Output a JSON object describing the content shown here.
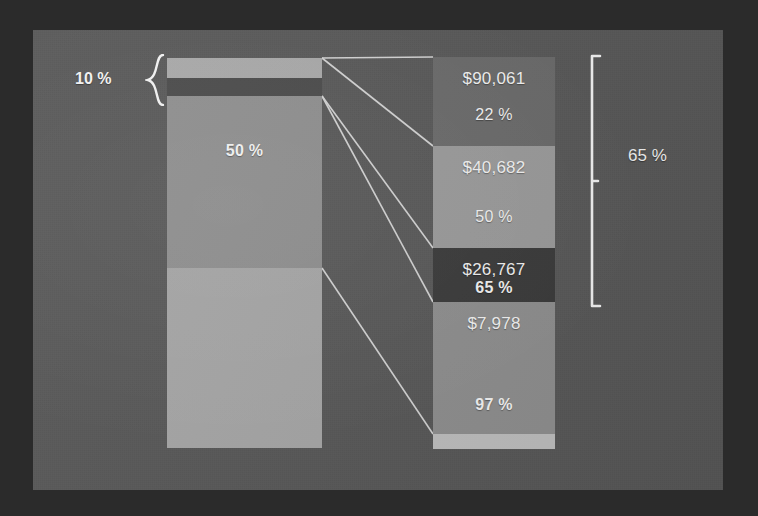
{
  "slide": {
    "background_color": "#585858",
    "frame_color": "#2b2b2b"
  },
  "left_bar": {
    "name": "left-stacked-bar",
    "x": 134,
    "y": 28,
    "width": 155,
    "height": 390,
    "segments": [
      {
        "id": "left-seg-top-light",
        "color": "#a8a8a8",
        "top": 0,
        "height": 20,
        "label": ""
      },
      {
        "id": "left-seg-dark-band",
        "color": "#4a4a4a",
        "top": 20,
        "height": 18,
        "label": ""
      },
      {
        "id": "left-seg-mid",
        "color": "#8e8e8e",
        "top": 38,
        "height": 172,
        "label": "50 %"
      },
      {
        "id": "left-seg-bottom",
        "color": "#a5a5a5",
        "top": 210,
        "height": 180,
        "label": ""
      }
    ],
    "brace_label": "10 %"
  },
  "right_bar": {
    "name": "right-stacked-bar",
    "x": 400,
    "y": 27,
    "width": 122,
    "height": 392,
    "segments": [
      {
        "id": "right-seg-1",
        "color": "#6a6a6a",
        "top": 0,
        "height": 89,
        "value": "$90,061",
        "percent": "22 %",
        "percent_bold": false
      },
      {
        "id": "right-seg-2",
        "color": "#9a9a9a",
        "top": 89,
        "height": 102,
        "value": "$40,682",
        "percent": "50 %",
        "percent_bold": false
      },
      {
        "id": "right-seg-3",
        "color": "#3a3a3a",
        "top": 191,
        "height": 54,
        "value": "$26,767",
        "percent": "65 %",
        "percent_bold": true
      },
      {
        "id": "right-seg-4",
        "color": "#8e8e8e",
        "top": 245,
        "height": 132,
        "value": "$7,978",
        "percent": "97 %",
        "percent_bold": true
      },
      {
        "id": "right-seg-5",
        "color": "#bdbdbd",
        "top": 377,
        "height": 15,
        "value": "",
        "percent": "",
        "percent_bold": false
      }
    ],
    "bracket_label": "65 %"
  },
  "chart_data": {
    "type": "bar",
    "title": "",
    "xlabel": "",
    "ylabel": "",
    "grid": false,
    "legend": "none",
    "series": [
      {
        "name": "Left stacked bar (share of total)",
        "categories": [
          "Top light band",
          "Dark band",
          "Middle segment",
          "Bottom segment"
        ],
        "values": [
          5,
          5,
          44,
          46
        ],
        "labels": [
          "",
          "",
          "50 %",
          ""
        ],
        "annotations": [
          "10 % bracket spans top light band + dark band"
        ]
      },
      {
        "name": "Right detail bar (dollar amounts and rates)",
        "categories": [
          "$90,061",
          "$40,682",
          "$26,767",
          "$7,978",
          ""
        ],
        "values": [
          90061,
          40682,
          26767,
          7978,
          0
        ],
        "percents": [
          "22 %",
          "50 %",
          "65 %",
          "97 %",
          ""
        ],
        "heights_px": [
          89,
          102,
          54,
          132,
          15
        ],
        "annotations": [
          "65 % bracket spans the first three right-hand segments"
        ]
      }
    ],
    "callout_percentages": [
      "10 %",
      "50 %",
      "22 %",
      "50 %",
      "65 %",
      "97 %",
      "65 %"
    ],
    "dollar_values": [
      "$90,061",
      "$40,682",
      "$26,767",
      "$7,978"
    ]
  }
}
